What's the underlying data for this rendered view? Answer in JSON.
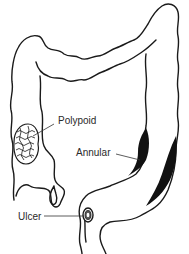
{
  "diagram": {
    "labels": {
      "polypoid": "Polypoid",
      "annular": "Annular",
      "ulcer": "Ulcer"
    },
    "colors": {
      "outline": "#1a1a1a",
      "lesion_fill": "#111111",
      "background": "#ffffff"
    }
  }
}
